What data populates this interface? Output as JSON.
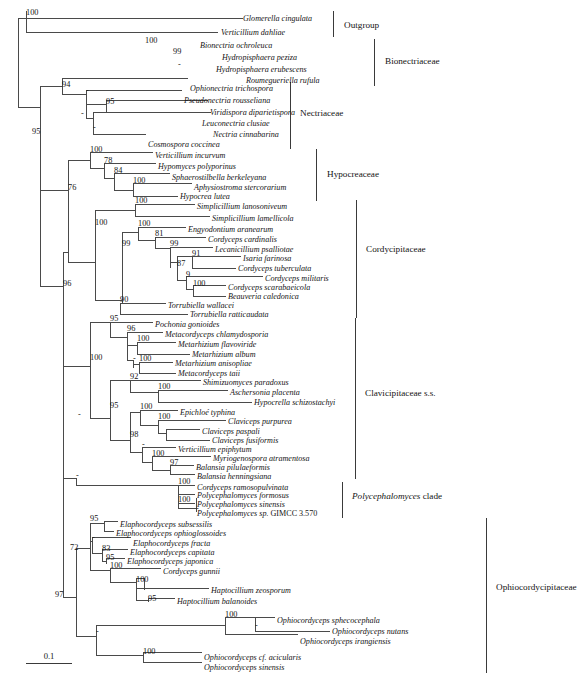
{
  "figure": {
    "type": "phylogenetic-tree",
    "scale_bar": {
      "label": "0.1",
      "length_px": 46
    }
  },
  "taxa": [
    {
      "id": "t1",
      "name": "Glomerella cingulata",
      "y": 18,
      "x": 243
    },
    {
      "id": "t2",
      "name": "Verticillium dahliae",
      "y": 32,
      "x": 221
    },
    {
      "id": "t3",
      "name": "Bionectria ochroleuca",
      "y": 45,
      "x": 200
    },
    {
      "id": "t4",
      "name": "Hydropisphaera peziza",
      "y": 57,
      "x": 222
    },
    {
      "id": "t5",
      "name": "Hydropisphaera erubescens",
      "y": 69,
      "x": 216
    },
    {
      "id": "t6",
      "name": "Roumegueriella rufula",
      "y": 80,
      "x": 246
    },
    {
      "id": "t7",
      "name": "Ophionectria trichospora",
      "y": 88,
      "x": 190
    },
    {
      "id": "t8",
      "name": "Pseudonectria rousseliana",
      "y": 100,
      "x": 184
    },
    {
      "id": "t9",
      "name": "Viridispora diparietispora",
      "y": 112,
      "x": 210
    },
    {
      "id": "t10",
      "name": "Leuconectria clusiae",
      "y": 123,
      "x": 202
    },
    {
      "id": "t11",
      "name": "Nectria cinnabarina",
      "y": 134,
      "x": 213
    },
    {
      "id": "t12",
      "name": "Cosmospora coccinea",
      "y": 144,
      "x": 148
    },
    {
      "id": "t13",
      "name": "Verticillium incurvum",
      "y": 155,
      "x": 155
    },
    {
      "id": "t14",
      "name": "Hypomyces polyporinus",
      "y": 166,
      "x": 158
    },
    {
      "id": "t15",
      "name": "Sphaerostilbella berkeleyana",
      "y": 177,
      "x": 172
    },
    {
      "id": "t16",
      "name": "Aphysiostroma stercorarium",
      "y": 187,
      "x": 194
    },
    {
      "id": "t17",
      "name": "Hypocrea lutea",
      "y": 196,
      "x": 180
    },
    {
      "id": "t18",
      "name": "Simplicillium lanosoniveum",
      "y": 206,
      "x": 197
    },
    {
      "id": "t19",
      "name": "Simplicillium lamellicola",
      "y": 218,
      "x": 212
    },
    {
      "id": "t20",
      "name": "Engyodontium aranearum",
      "y": 229,
      "x": 188
    },
    {
      "id": "t21",
      "name": "Cordyceps cardinalis",
      "y": 239,
      "x": 208
    },
    {
      "id": "t22",
      "name": "Lecanicillium psalliotae",
      "y": 249,
      "x": 215
    },
    {
      "id": "t23",
      "name": "Isaria farinosa",
      "y": 258,
      "x": 243
    },
    {
      "id": "t24",
      "name": "Cordyceps tuberculata",
      "y": 268,
      "x": 238
    },
    {
      "id": "t25",
      "name": "Cordyceps militaris",
      "y": 278,
      "x": 265
    },
    {
      "id": "t26",
      "name": "Cordyceps scarabaeicola",
      "y": 287,
      "x": 228
    },
    {
      "id": "t27",
      "name": "Beauveria caledonica",
      "y": 296,
      "x": 228
    },
    {
      "id": "t28",
      "name": "Torrubiella wallacei",
      "y": 305,
      "x": 168
    },
    {
      "id": "t29",
      "name": "Torrubiella ratticaudata",
      "y": 314,
      "x": 190
    },
    {
      "id": "t30",
      "name": "Pochonia gonioides",
      "y": 324,
      "x": 155
    },
    {
      "id": "t31",
      "name": "Metacordyceps chlamydosporia",
      "y": 334,
      "x": 165
    },
    {
      "id": "t32",
      "name": "Metarhizium flavoviride",
      "y": 344,
      "x": 178
    },
    {
      "id": "t33",
      "name": "Metarhizium album",
      "y": 354,
      "x": 192
    },
    {
      "id": "t34",
      "name": "Metarhizium anisopliae",
      "y": 363,
      "x": 175
    },
    {
      "id": "t35",
      "name": "Metacordyceps taii",
      "y": 373,
      "x": 178
    },
    {
      "id": "t36",
      "name": "Shimizuomyces paradoxus",
      "y": 382,
      "x": 203
    },
    {
      "id": "t37",
      "name": "Aschersonia placenta",
      "y": 392,
      "x": 230
    },
    {
      "id": "t38",
      "name": "Hypocrella schizostachyi",
      "y": 402,
      "x": 254
    },
    {
      "id": "t39",
      "name": "Epichloé typhina",
      "y": 412,
      "x": 180
    },
    {
      "id": "t40",
      "name": "Claviceps purpurea",
      "y": 421,
      "x": 228
    },
    {
      "id": "t41",
      "name": "Claviceps paspali",
      "y": 431,
      "x": 202
    },
    {
      "id": "t42",
      "name": "Claviceps fusiformis",
      "y": 440,
      "x": 212
    },
    {
      "id": "t43",
      "name": "Verticillium epiphytum",
      "y": 449,
      "x": 178
    },
    {
      "id": "t44",
      "name": "Myriogenospora atramentosa",
      "y": 458,
      "x": 213
    },
    {
      "id": "t45",
      "name": "Balansia pilulaeformis",
      "y": 467,
      "x": 196
    },
    {
      "id": "t46",
      "name": "Balansia henningsiana",
      "y": 476,
      "x": 197
    },
    {
      "id": "t47",
      "name": "Cordyceps ramosopulvinata",
      "y": 487,
      "x": 197
    },
    {
      "id": "t48",
      "name": "Polycephalomyces formosus",
      "y": 495,
      "x": 197
    },
    {
      "id": "t49",
      "name": "Polycephalomyces sinensis",
      "y": 504,
      "x": 197
    },
    {
      "id": "t50",
      "name": "Polycephalomyces sp.",
      "suffix": " GIMCC 3.570",
      "y": 513,
      "x": 197
    },
    {
      "id": "t51",
      "name": "Elaphocordyceps subsessilis",
      "y": 524,
      "x": 120
    },
    {
      "id": "t52",
      "name": "Elaphocordyceps ophioglossoides",
      "y": 533,
      "x": 116
    },
    {
      "id": "t53",
      "name": "Elaphocordyceps fracta",
      "y": 543,
      "x": 133
    },
    {
      "id": "t54",
      "name": "Elaphocordyceps capitata",
      "y": 552,
      "x": 130
    },
    {
      "id": "t55",
      "name": "Elaphocordyceps japonica",
      "y": 561,
      "x": 127
    },
    {
      "id": "t56",
      "name": "Cordyceps gunnii",
      "y": 571,
      "x": 163
    },
    {
      "id": "t57",
      "name": "Haptocillium zeosporum",
      "y": 590,
      "x": 211
    },
    {
      "id": "t58",
      "name": "Haptocillium balanoides",
      "y": 601,
      "x": 177
    },
    {
      "id": "t59",
      "name": "Ophiocordyceps sphecocephala",
      "y": 620,
      "x": 277
    },
    {
      "id": "t60",
      "name": "Ophiocordyceps nutans",
      "y": 631,
      "x": 332
    },
    {
      "id": "t61",
      "name": "Ophiocordyceps irangiensis",
      "y": 641,
      "x": 300
    },
    {
      "id": "t62",
      "name": "Ophiocordyceps cf. acicularis",
      "y": 657,
      "x": 204
    },
    {
      "id": "t63",
      "name": "Ophiocordyceps sinensis",
      "y": 667,
      "x": 204
    }
  ],
  "supports": [
    {
      "value": "100",
      "x": 26,
      "y": 15,
      "anchor": "start"
    },
    {
      "value": "100",
      "x": 145,
      "y": 43,
      "anchor": "start"
    },
    {
      "value": "99",
      "x": 173,
      "y": 54,
      "anchor": "start"
    },
    {
      "value": "-",
      "x": 178,
      "y": 67,
      "anchor": "start"
    },
    {
      "value": "94",
      "x": 62,
      "y": 87,
      "anchor": "start"
    },
    {
      "value": "-",
      "x": 86,
      "y": 93,
      "anchor": "start"
    },
    {
      "value": "95",
      "x": 106,
      "y": 104,
      "anchor": "start"
    },
    {
      "value": "-",
      "x": 81,
      "y": 116,
      "anchor": "start"
    },
    {
      "value": "-",
      "x": 93,
      "y": 130,
      "anchor": "start"
    },
    {
      "value": "95",
      "x": 32,
      "y": 134,
      "anchor": "start"
    },
    {
      "value": "100",
      "x": 90,
      "y": 152,
      "anchor": "start"
    },
    {
      "value": "78",
      "x": 104,
      "y": 163,
      "anchor": "start"
    },
    {
      "value": "84",
      "x": 114,
      "y": 173,
      "anchor": "start"
    },
    {
      "value": "100",
      "x": 133,
      "y": 183,
      "anchor": "start"
    },
    {
      "value": "76",
      "x": 68,
      "y": 190,
      "anchor": "start"
    },
    {
      "value": "100",
      "x": 135,
      "y": 203,
      "anchor": "start"
    },
    {
      "value": "100",
      "x": 95,
      "y": 225,
      "anchor": "start"
    },
    {
      "value": "100",
      "x": 138,
      "y": 226,
      "anchor": "start"
    },
    {
      "value": "81",
      "x": 155,
      "y": 236,
      "anchor": "start"
    },
    {
      "value": "99",
      "x": 122,
      "y": 246,
      "anchor": "start"
    },
    {
      "value": "99",
      "x": 170,
      "y": 246,
      "anchor": "start"
    },
    {
      "value": "91",
      "x": 192,
      "y": 256,
      "anchor": "start"
    },
    {
      "value": "87",
      "x": 177,
      "y": 266,
      "anchor": "start"
    },
    {
      "value": "9",
      "x": 186,
      "y": 277,
      "anchor": "start"
    },
    {
      "value": "100",
      "x": 193,
      "y": 286,
      "anchor": "start"
    },
    {
      "value": "90",
      "x": 120,
      "y": 302,
      "anchor": "start"
    },
    {
      "value": "95",
      "x": 110,
      "y": 321,
      "anchor": "start"
    },
    {
      "value": "96",
      "x": 127,
      "y": 331,
      "anchor": "start"
    },
    {
      "value": "100",
      "x": 137,
      "y": 341,
      "anchor": "start"
    },
    {
      "value": "-",
      "x": 133,
      "y": 361,
      "anchor": "start"
    },
    {
      "value": "100",
      "x": 139,
      "y": 361,
      "anchor": "start"
    },
    {
      "value": "100",
      "x": 90,
      "y": 360,
      "anchor": "start"
    },
    {
      "value": "92",
      "x": 130,
      "y": 379,
      "anchor": "start"
    },
    {
      "value": "100",
      "x": 158,
      "y": 389,
      "anchor": "start"
    },
    {
      "value": "95",
      "x": 110,
      "y": 408,
      "anchor": "start"
    },
    {
      "value": "100",
      "x": 140,
      "y": 409,
      "anchor": "start"
    },
    {
      "value": "100",
      "x": 158,
      "y": 419,
      "anchor": "start"
    },
    {
      "value": "98",
      "x": 130,
      "y": 437,
      "anchor": "start"
    },
    {
      "value": "-",
      "x": 142,
      "y": 447,
      "anchor": "start"
    },
    {
      "value": "100",
      "x": 152,
      "y": 456,
      "anchor": "start"
    },
    {
      "value": "-",
      "x": 78,
      "y": 417,
      "anchor": "start"
    },
    {
      "value": "96",
      "x": 63,
      "y": 286,
      "anchor": "start"
    },
    {
      "value": "97",
      "x": 170,
      "y": 465,
      "anchor": "start"
    },
    {
      "value": "100",
      "x": 178,
      "y": 484,
      "anchor": "start"
    },
    {
      "value": "100",
      "x": 178,
      "y": 502,
      "anchor": "start"
    },
    {
      "value": "-",
      "x": 196,
      "y": 511,
      "anchor": "start"
    },
    {
      "value": "-",
      "x": 76,
      "y": 478,
      "anchor": "start"
    },
    {
      "value": "95",
      "x": 90,
      "y": 521,
      "anchor": "start"
    },
    {
      "value": "-",
      "x": 92,
      "y": 540,
      "anchor": "start"
    },
    {
      "value": "72",
      "x": 70,
      "y": 550,
      "anchor": "start"
    },
    {
      "value": "83",
      "x": 102,
      "y": 551,
      "anchor": "start"
    },
    {
      "value": "95",
      "x": 106,
      "y": 560,
      "anchor": "start"
    },
    {
      "value": "100",
      "x": 110,
      "y": 568,
      "anchor": "start"
    },
    {
      "value": "100",
      "x": 136,
      "y": 582,
      "anchor": "start"
    },
    {
      "value": "95",
      "x": 148,
      "y": 601,
      "anchor": "start"
    },
    {
      "value": "97",
      "x": 55,
      "y": 597,
      "anchor": "start"
    },
    {
      "value": "-",
      "x": 96,
      "y": 634,
      "anchor": "start"
    },
    {
      "value": "100",
      "x": 225,
      "y": 617,
      "anchor": "start"
    },
    {
      "value": "-",
      "x": 255,
      "y": 628,
      "anchor": "start"
    },
    {
      "value": "100",
      "x": 143,
      "y": 654,
      "anchor": "start"
    }
  ],
  "clade_labels": [
    {
      "label": "Outgroup",
      "x": 344,
      "y": 28,
      "bar_x": 333,
      "bar_y1": 11,
      "bar_y2": 37,
      "italic_prefix": ""
    },
    {
      "label": "Bionectriaceae",
      "x": 385,
      "y": 64,
      "bar_x": 374,
      "bar_y1": 39,
      "bar_y2": 86,
      "italic_prefix": ""
    },
    {
      "label": "Nectriaceae",
      "x": 300,
      "y": 116,
      "bar_x": 290,
      "bar_y1": 82,
      "bar_y2": 149,
      "italic_prefix": ""
    },
    {
      "label": "Hypocreaceae",
      "x": 327,
      "y": 177,
      "bar_x": 316,
      "bar_y1": 149,
      "bar_y2": 201,
      "italic_prefix": ""
    },
    {
      "label": "Cordycipitaceae",
      "x": 366,
      "y": 252,
      "bar_x": 356,
      "bar_y1": 200,
      "bar_y2": 318,
      "italic_prefix": ""
    },
    {
      "label": "Clavicipitaceae s.s.",
      "x": 365,
      "y": 396,
      "bar_x": 355,
      "bar_y1": 318,
      "bar_y2": 479,
      "italic_prefix": ""
    },
    {
      "label": " clade",
      "x": 352,
      "y": 499,
      "bar_x": 342,
      "bar_y1": 482,
      "bar_y2": 518,
      "italic_prefix": "Polycephalomyces"
    },
    {
      "label": "Ophiocordycipitaceae",
      "x": 496,
      "y": 590,
      "bar_x": 486,
      "bar_y1": 518,
      "bar_y2": 673,
      "italic_prefix": ""
    }
  ],
  "branches": [
    "M 18,25 L 18,107",
    "M 18,18 L 18,32 M 18,18 L 26,18",
    "M 26,11 L 26,32",
    "M 26,18 L 47,18 L 47,18 L 243,18",
    "M 26,32 L 218,32",
    "M 18,107 L 40,107",
    "M 40,86 L 40,128",
    "M 40,86 L 62,86",
    "M 62,78 L 62,94",
    "M 62,78 L 188,78",
    "M 62,94 L 86,94",
    "M 86,90 L 86,118",
    "M 86,90 L 182,90",
    "M 86,104 L 106,104",
    "M 106,100 L 106,112",
    "M 106,100 L 208,100",
    "M 106,112 L 200,112",
    "M 86,118 L 93,118",
    "M 93,112 L 93,134",
    "M 93,112 L 211,112",
    "M 93,134 L 146,134",
    "M 40,128 L 40,190",
    "M 40,190 L 68,190",
    "M 68,160 L 68,262",
    "M 68,160 L 90,160",
    "M 90,152 L 90,168",
    "M 90,152 L 153,152",
    "M 90,168 L 104,168",
    "M 104,163 L 104,178",
    "M 104,163 L 156,163",
    "M 104,178 L 114,178",
    "M 114,173 L 114,190",
    "M 114,173 L 170,173",
    "M 114,190 L 133,190",
    "M 133,183 L 133,196",
    "M 133,183 L 192,183",
    "M 133,196 L 178,196",
    "M 68,262 L 95,262",
    "M 95,210 L 95,300",
    "M 95,210 L 135,210",
    "M 135,204 L 135,216",
    "M 135,204 L 195,204",
    "M 135,216 L 210,216",
    "M 95,300 L 122,300",
    "M 122,232 L 122,303",
    "M 122,232 L 138,232",
    "M 138,227 L 138,240",
    "M 138,227 L 186,227",
    "M 138,240 L 155,240",
    "M 155,237 L 155,248",
    "M 155,237 L 206,237",
    "M 155,248 L 170,248",
    "M 170,247 L 170,268",
    "M 170,247 L 213,247",
    "M 170,262 L 177,262",
    "M 177,256 L 177,280",
    "M 177,256 L 192,256",
    "M 192,256 L 192,268",
    "M 192,256 L 241,256",
    "M 192,268 L 236,268",
    "M 177,280 L 186,280",
    "M 186,276 L 186,289",
    "M 186,276 L 263,276",
    "M 186,289 L 193,289",
    "M 193,285 L 193,296",
    "M 193,285 L 226,285",
    "M 193,296 L 226,296",
    "M 122,303 L 120,303",
    "M 120,303 L 120,314",
    "M 120,303 L 166,303",
    "M 120,314 L 188,314",
    "M 40,190 L 40,286",
    "M 40,286 L 63,286",
    "M 63,286 L 63,286",
    "M 63,252 L 63,478",
    "M 63,252 L 68,252",
    "M 63,478 L 76,478",
    "M 76,478 L 76,485",
    "M 76,485 L 90,485",
    "M 90,485 L 90,485",
    "M 63,366 L 90,366",
    "M 90,322 L 90,418",
    "M 90,322 L 110,322",
    "M 110,322 L 110,337",
    "M 110,322 L 153,322",
    "M 110,337 L 127,337",
    "M 127,332 L 127,360",
    "M 127,332 L 163,332",
    "M 127,345 L 137,345",
    "M 137,342 L 137,354",
    "M 137,342 L 176,342",
    "M 137,354 L 190,354",
    "M 127,360 L 133,360",
    "M 133,360 L 133,368",
    "M 133,364 L 139,364",
    "M 139,362 L 139,373",
    "M 139,362 L 173,362",
    "M 139,373 L 176,373",
    "M 90,418 L 110,418",
    "M 110,380 L 110,440",
    "M 110,380 L 130,380",
    "M 130,380 L 130,392",
    "M 130,380 L 201,380",
    "M 130,392 L 158,392",
    "M 158,390 L 158,402",
    "M 158,390 L 228,390",
    "M 158,402 L 252,402",
    "M 110,440 L 130,440",
    "M 130,412 L 130,452",
    "M 130,412 L 140,412",
    "M 140,410 L 140,425",
    "M 140,410 L 178,410",
    "M 140,425 L 158,425",
    "M 158,420 L 158,433",
    "M 158,420 L 226,420",
    "M 158,433 L 166,433",
    "M 166,429 L 166,440",
    "M 166,429 L 200,429",
    "M 166,440 L 210,440",
    "M 130,452 L 142,452",
    "M 142,447 L 142,462",
    "M 142,447 L 176,447",
    "M 142,462 L 152,462",
    "M 152,456 L 152,470",
    "M 152,456 L 211,456",
    "M 152,470 L 170,470",
    "M 170,465 L 170,474",
    "M 170,465 L 194,465",
    "M 170,474 L 195,474",
    "M 76,485 L 178,485",
    "M 178,485 L 178,508",
    "M 178,485 L 195,485",
    "M 178,494 L 195,494",
    "M 178,503 L 195,503",
    "M 196,498 L 196,512",
    "M 178,508 L 196,508",
    "M 196,512 L 196,512",
    "M 63,478 L 63,597",
    "M 63,597 L 76,597",
    "M 76,548 L 76,636",
    "M 76,548 L 90,548",
    "M 90,523 L 90,570",
    "M 90,523 L 104,523",
    "M 104,521 L 104,531",
    "M 104,521 L 118,521",
    "M 104,531 L 114,531",
    "M 90,541 L 92,541",
    "M 92,537 L 92,553",
    "M 92,537 L 131,537",
    "M 92,553 L 102,553",
    "M 102,549 L 102,561",
    "M 102,549 L 128,549",
    "M 102,561 L 106,561",
    "M 106,558 L 106,564",
    "M 106,558 L 125,558",
    "M 90,570 L 110,570",
    "M 110,568 L 110,582",
    "M 110,568 L 161,568",
    "M 110,582 L 136,582",
    "M 136,578 L 136,600",
    "M 136,588 L 209,588",
    "M 136,578 L 144,578",
    "M 144,578 L 144,590",
    "M 136,600 L 148,600",
    "M 148,598 L 148,602",
    "M 148,598 L 175,598",
    "M 76,636 L 96,636",
    "M 96,625 L 96,655",
    "M 96,625 L 225,625",
    "M 225,617 L 225,634",
    "M 225,617 L 255,617",
    "M 255,617 L 255,631",
    "M 255,617 L 275,617",
    "M 255,631 L 330,631",
    "M 225,634 L 298,634",
    "M 96,655 L 143,655",
    "M 143,652 L 143,662",
    "M 143,652 L 202,652",
    "M 143,662 L 202,662"
  ]
}
